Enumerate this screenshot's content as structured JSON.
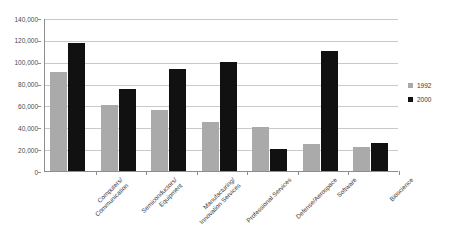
{
  "chart_data": {
    "type": "bar",
    "title": "",
    "subtitle": "",
    "xlabel": "",
    "ylabel": "",
    "ylim": [
      0,
      140000
    ],
    "ytick_step": 20000,
    "ytick_labels": [
      "140,000",
      "120,000",
      "100,000",
      "80,000",
      "60,000",
      "40,000",
      "20,000",
      "0"
    ],
    "ytick_values": [
      140000,
      120000,
      100000,
      80000,
      60000,
      40000,
      20000,
      0
    ],
    "grid": true,
    "legend_position": "right",
    "categories": [
      "Computers/\nCommunication",
      "Semiconductors/\nEquipment",
      "Manufacturing/\nInnovation Services",
      "Professional Services",
      "Defense/Aerospace",
      "Software",
      "Bioscience"
    ],
    "category_lines": [
      [
        "Computers/",
        "Communication"
      ],
      [
        "Semiconductors/",
        "Equipment"
      ],
      [
        "Manufacturing/",
        "Innovation Services"
      ],
      [
        "Professional Services"
      ],
      [
        "Defense/Aerospace"
      ],
      [
        "Software"
      ],
      [
        "Bioscience"
      ]
    ],
    "series": [
      {
        "name": "1992",
        "color": "#aaaaaa",
        "values": [
          91000,
          60000,
          56000,
          45000,
          40000,
          25000,
          22000
        ]
      },
      {
        "name": "2000",
        "color": "#111111",
        "values": [
          117500,
          75000,
          93000,
          100000,
          20500,
          110000,
          26000
        ]
      }
    ]
  },
  "legend": {
    "items": [
      {
        "label": "1992",
        "swatch": "#aaaaaa"
      },
      {
        "label": "2000",
        "swatch": "#111111"
      }
    ]
  },
  "colors": {
    "series_1992": "#aaaaaa",
    "series_2000": "#111111",
    "gridline": "#c9c9c9",
    "axis": "#8d8d8d",
    "background": "#ffffff",
    "text": "#3a3a3a"
  }
}
